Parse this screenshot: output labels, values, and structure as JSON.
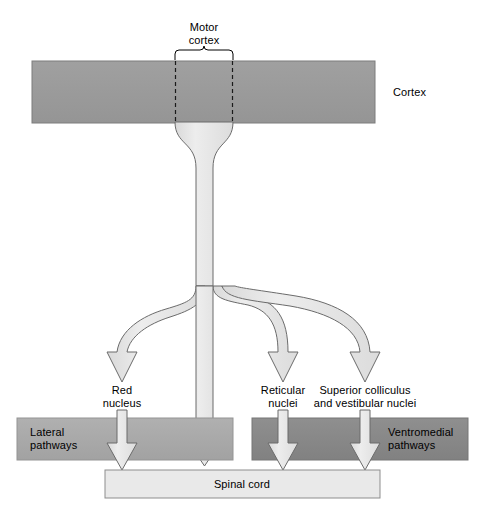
{
  "figure": {
    "type": "anatomical-flow-diagram"
  },
  "regions": {
    "cortex": {
      "label": "Cortex",
      "color": "#999999"
    },
    "motor_cortex": {
      "label_line1": "Motor",
      "label_line2": "cortex"
    },
    "lateral_pathways": {
      "label_line1": "Lateral",
      "label_line2": "pathways",
      "color": "#a9a9a9"
    },
    "ventromedial_pathways": {
      "label_line1": "Ventromedial",
      "label_line2": "pathways",
      "color": "#888888"
    },
    "spinal_cord": {
      "label": "Spinal cord",
      "color": "#e9e9e9"
    }
  },
  "nuclei": [
    {
      "id": "red-nucleus",
      "label_line1": "Red",
      "label_line2": "nucleus",
      "x": 122
    },
    {
      "id": "reticular-nuclei",
      "label_line1": "Reticular",
      "label_line2": "nuclei",
      "x": 283
    },
    {
      "id": "superior-colliculus-vestibular-nuclei",
      "label_line1": "Superior colliculus",
      "label_line2": "and vestibular nuclei",
      "x": 365
    }
  ],
  "colors": {
    "cortex_gray": "#999999",
    "lateral_gray": "#a9a9a9",
    "ventromedial_gray": "#888888",
    "spinal_light": "#e9e9e9",
    "tract_fill": "#e4e4e4",
    "stroke": "#6b6b6b",
    "text": "#000000"
  }
}
